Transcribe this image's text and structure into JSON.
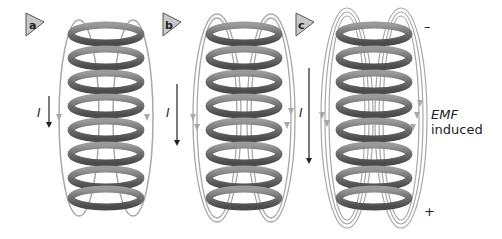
{
  "figure": {
    "panels": [
      {
        "label": "a",
        "current_label": "I",
        "field_loops": 1
      },
      {
        "label": "b",
        "current_label": "I",
        "field_loops": 2
      },
      {
        "label": "c",
        "current_label": "I",
        "field_loops": 3
      }
    ],
    "emf": {
      "label_line1": "EMF",
      "label_line2": "induced",
      "minus": "–",
      "plus": "+"
    },
    "colors": {
      "coil": "#6e6e6e",
      "coil_dark": "#4a4a4a",
      "coil_light": "#9a9a9a",
      "field_line": "#a8a8a8",
      "badge_fill": "#c8c8c8",
      "badge_stroke": "#555555",
      "arrow": "#222222"
    }
  }
}
